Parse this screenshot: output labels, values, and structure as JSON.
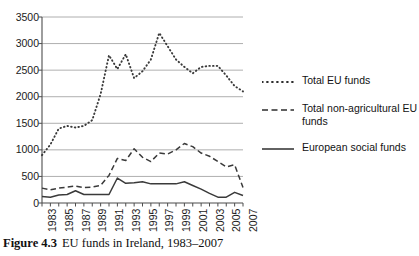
{
  "figure": {
    "caption_label": "Figure 4.3",
    "caption_text": "EU funds in Ireland, 1983–2007"
  },
  "legend": {
    "position": "right",
    "items": [
      {
        "label": "Total EU funds",
        "style": "dotted",
        "swatch_name": "legend-swatch-dotted"
      },
      {
        "label": "Total non-agricultural EU funds",
        "style": "dashed",
        "swatch_name": "legend-swatch-dashed"
      },
      {
        "label": "European social funds",
        "style": "solid",
        "swatch_name": "legend-swatch-solid"
      }
    ]
  },
  "chart_data": {
    "type": "line",
    "title": "",
    "xlabel": "",
    "ylabel": "",
    "ylim": [
      0,
      3500
    ],
    "yticks": [
      0,
      500,
      1000,
      1500,
      2000,
      2500,
      3000,
      3500
    ],
    "ytick_labels": [
      "0",
      "500",
      "1000",
      "1500",
      "2000",
      "2500",
      "3000",
      "3500"
    ],
    "grid": true,
    "x": [
      1983,
      1984,
      1985,
      1986,
      1987,
      1988,
      1989,
      1990,
      1991,
      1992,
      1993,
      1994,
      1995,
      1996,
      1997,
      1998,
      1999,
      2000,
      2001,
      2002,
      2003,
      2004,
      2005,
      2006,
      2007
    ],
    "xtick_labels": [
      "1983",
      "1985",
      "1987",
      "1989",
      "1991",
      "1993",
      "1995",
      "1997",
      "1999",
      "2001",
      "2003",
      "2005",
      "2007"
    ],
    "xticks": [
      1983,
      1985,
      1987,
      1989,
      1991,
      1993,
      1995,
      1997,
      1999,
      2001,
      2003,
      2005,
      2007
    ],
    "series": [
      {
        "name": "Total EU funds",
        "style": "dotted",
        "values": [
          900,
          1100,
          1400,
          1450,
          1420,
          1450,
          1560,
          2050,
          2780,
          2520,
          2800,
          2350,
          2480,
          2700,
          3200,
          2950,
          2700,
          2560,
          2440,
          2560,
          2580,
          2580,
          2400,
          2200,
          2100
        ]
      },
      {
        "name": "Total non-agricultural EU funds",
        "style": "dashed",
        "values": [
          280,
          250,
          280,
          300,
          320,
          290,
          300,
          330,
          520,
          840,
          800,
          1020,
          860,
          780,
          940,
          920,
          1000,
          1120,
          1060,
          940,
          880,
          780,
          680,
          720,
          290
        ]
      },
      {
        "name": "European social funds",
        "style": "solid",
        "values": [
          120,
          110,
          150,
          160,
          230,
          160,
          160,
          160,
          160,
          470,
          370,
          380,
          400,
          360,
          360,
          360,
          360,
          400,
          330,
          260,
          180,
          110,
          110,
          200,
          140
        ]
      }
    ]
  }
}
